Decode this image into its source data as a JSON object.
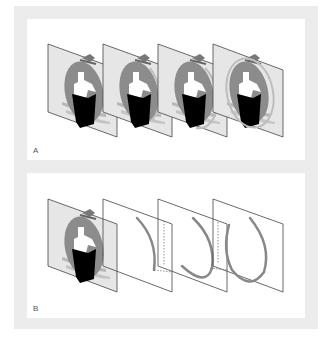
{
  "figure": {
    "panels": [
      {
        "id": "A",
        "label": "A",
        "description": "Four identical animation frames of a ship icon with progressively drawn circular ring"
      },
      {
        "id": "B",
        "label": "B",
        "description": "Base ship-icon frame followed by three transparent layers showing the ring arc growing from small arc to nearly full circle"
      }
    ]
  },
  "section_a": {
    "label": "A",
    "frames": [
      {
        "index": 1,
        "content": "ship-icon",
        "ring_progress": 0.0
      },
      {
        "index": 2,
        "content": "ship-icon",
        "ring_progress": 0.33
      },
      {
        "index": 3,
        "content": "ship-icon",
        "ring_progress": 0.66
      },
      {
        "index": 4,
        "content": "ship-icon",
        "ring_progress": 1.0
      }
    ]
  },
  "section_b": {
    "label": "B",
    "frames": [
      {
        "index": 1,
        "content": "ship-icon"
      },
      {
        "index": 2,
        "content": "ring-arc-small"
      },
      {
        "index": 3,
        "content": "ring-arc-medium"
      },
      {
        "index": 4,
        "content": "ring-arc-large"
      }
    ]
  },
  "colors": {
    "frame_bg": "#ececec",
    "panel_fill": "#e6e6e6",
    "panel_stroke": "#444444",
    "ellipse": "#8a8a8a",
    "hull": "#000000",
    "tower": "#ffffff",
    "waves": "#b5b5b5",
    "ring": "#7a7a7a"
  }
}
